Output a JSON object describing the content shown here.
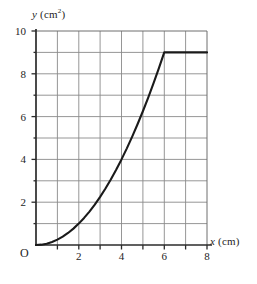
{
  "chart_data": {
    "type": "line",
    "title": "",
    "subtitle": "",
    "xlabel_var": "x",
    "xlabel_unit": "(cm)",
    "ylabel_var": "y",
    "ylabel_unit": "(cm",
    "ylabel_exponent": "2",
    "ylabel_unit_close": ")",
    "xlim": [
      0,
      8
    ],
    "ylim": [
      0,
      10
    ],
    "xticks": [
      0,
      2,
      4,
      6,
      8
    ],
    "xtick_labels": [
      "O",
      "2",
      "4",
      "6",
      "8"
    ],
    "yticks": [
      0,
      2,
      4,
      6,
      8,
      10
    ],
    "ytick_labels": [
      "",
      "2",
      "4",
      "6",
      "8",
      "10"
    ],
    "minor_gridline_step_x": 1,
    "minor_gridline_step_y": 1,
    "grid": true,
    "legend": false,
    "legend_position": "none",
    "line_color": "#1a1a1a",
    "grid_color": "#8a8a8a",
    "axis_color": "#2b2b2b",
    "background_color": "#ffffff",
    "annotations": [],
    "series": [
      {
        "name": "y = x²/4 then constant",
        "description": "Parabolic rise from origin to (6, 9), then horizontal at y = 9 to x = 8",
        "x": [
          0,
          0.25,
          0.5,
          0.75,
          1,
          1.25,
          1.5,
          1.75,
          2,
          2.25,
          2.5,
          2.75,
          3,
          3.25,
          3.5,
          3.75,
          4,
          4.25,
          4.5,
          4.75,
          5,
          5.25,
          5.5,
          5.75,
          6,
          6.5,
          7,
          7.5,
          8
        ],
        "y": [
          0,
          0.0156,
          0.0625,
          0.1406,
          0.25,
          0.3906,
          0.5625,
          0.7656,
          1,
          1.2656,
          1.5625,
          1.8906,
          2.25,
          2.6406,
          3.0625,
          3.5156,
          4,
          4.5156,
          5.0625,
          5.6406,
          6.25,
          6.8906,
          7.5625,
          8.2656,
          9,
          9,
          9,
          9,
          9
        ]
      }
    ],
    "key_points": [
      {
        "x": 0,
        "y": 0
      },
      {
        "x": 2,
        "y": 1
      },
      {
        "x": 4,
        "y": 4
      },
      {
        "x": 6,
        "y": 9
      },
      {
        "x": 8,
        "y": 9
      }
    ]
  }
}
